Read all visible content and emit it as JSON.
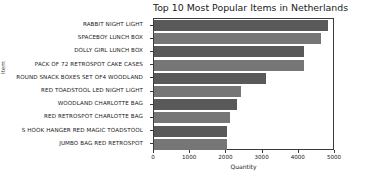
{
  "chart_data": {
    "type": "bar",
    "orientation": "horizontal",
    "title": "Top 10 Most Popular Items in Netherlands",
    "xlabel": "Quantity",
    "ylabel": "Item",
    "xlim": [
      0,
      5000
    ],
    "xticks": [
      0,
      1000,
      2000,
      3000,
      4000,
      5000
    ],
    "xtick_labels": [
      "0",
      "1000",
      "2000",
      "3000",
      "4000",
      "5000"
    ],
    "grid": false,
    "legend": null,
    "categories": [
      "RABBIT NIGHT LIGHT",
      "SPACEBOY LUNCH BOX",
      "DOLLY GIRL LUNCH BOX",
      "PACK OF 72 RETROSPOT CAKE CASES",
      "ROUND SNACK BOXES SET OF4 WOODLAND",
      "RED TOADSTOOL LED NIGHT LIGHT",
      "WOODLAND CHARLOTTE BAG",
      "RED RETROSPOT CHARLOTTE BAG",
      "S HOOK HANGER RED MAGIC TOADSTOOL",
      "JUMBO BAG RED RETROSPOT"
    ],
    "values": [
      4801,
      4600,
      4150,
      4150,
      3100,
      2400,
      2300,
      2100,
      2030,
      2020
    ],
    "bar_colors": [
      "#595959",
      "#767676",
      "#595959",
      "#767676",
      "#595959",
      "#767676",
      "#595959",
      "#767676",
      "#595959",
      "#767676"
    ]
  },
  "figure": {
    "background": "#ffffff",
    "axis_color": "#3b3b3b",
    "text_color": "#1a1a1a"
  }
}
